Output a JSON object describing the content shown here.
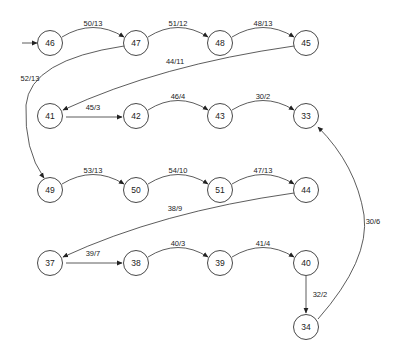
{
  "diagram": {
    "type": "state-transition-graph",
    "start_node": "46",
    "nodes": [
      {
        "id": "46",
        "label": "46",
        "x": 50,
        "y": 43
      },
      {
        "id": "47",
        "label": "47",
        "x": 136,
        "y": 43
      },
      {
        "id": "48",
        "label": "48",
        "x": 220,
        "y": 43
      },
      {
        "id": "45",
        "label": "45",
        "x": 306,
        "y": 43
      },
      {
        "id": "41",
        "label": "41",
        "x": 50,
        "y": 116
      },
      {
        "id": "42",
        "label": "42",
        "x": 136,
        "y": 116
      },
      {
        "id": "43",
        "label": "43",
        "x": 220,
        "y": 116
      },
      {
        "id": "33",
        "label": "33",
        "x": 306,
        "y": 116
      },
      {
        "id": "49",
        "label": "49",
        "x": 50,
        "y": 190
      },
      {
        "id": "50",
        "label": "50",
        "x": 136,
        "y": 190
      },
      {
        "id": "51",
        "label": "51",
        "x": 220,
        "y": 190
      },
      {
        "id": "44",
        "label": "44",
        "x": 306,
        "y": 190
      },
      {
        "id": "37",
        "label": "37",
        "x": 50,
        "y": 263
      },
      {
        "id": "38",
        "label": "38",
        "x": 136,
        "y": 263
      },
      {
        "id": "39",
        "label": "39",
        "x": 220,
        "y": 263
      },
      {
        "id": "40",
        "label": "40",
        "x": 306,
        "y": 263
      },
      {
        "id": "34",
        "label": "34",
        "x": 306,
        "y": 327
      }
    ],
    "edges": [
      {
        "from": "46",
        "to": "47",
        "label": "50/13"
      },
      {
        "from": "47",
        "to": "48",
        "label": "51/12"
      },
      {
        "from": "48",
        "to": "45",
        "label": "48/13"
      },
      {
        "from": "45",
        "to": "41",
        "label": "44/11"
      },
      {
        "from": "47",
        "to": "49",
        "label": "52/13"
      },
      {
        "from": "41",
        "to": "42",
        "label": "45/3"
      },
      {
        "from": "42",
        "to": "43",
        "label": "46/4"
      },
      {
        "from": "43",
        "to": "33",
        "label": "30/2"
      },
      {
        "from": "49",
        "to": "50",
        "label": "53/13"
      },
      {
        "from": "50",
        "to": "51",
        "label": "54/10"
      },
      {
        "from": "51",
        "to": "44",
        "label": "47/13"
      },
      {
        "from": "44",
        "to": "37",
        "label": "38/9"
      },
      {
        "from": "37",
        "to": "38",
        "label": "39/7"
      },
      {
        "from": "38",
        "to": "39",
        "label": "40/3"
      },
      {
        "from": "39",
        "to": "40",
        "label": "41/4"
      },
      {
        "from": "40",
        "to": "34",
        "label": "32/2"
      },
      {
        "from": "34",
        "to": "33",
        "label": "30/6"
      }
    ]
  },
  "nodes": {
    "n46": "46",
    "n47": "47",
    "n48": "48",
    "n45": "45",
    "n41": "41",
    "n42": "42",
    "n43": "43",
    "n33": "33",
    "n49": "49",
    "n50": "50",
    "n51": "51",
    "n44": "44",
    "n37": "37",
    "n38": "38",
    "n39": "39",
    "n40": "40",
    "n34": "34"
  },
  "edge_labels": {
    "e46_47": "50/13",
    "e47_48": "51/12",
    "e48_45": "48/13",
    "e45_41": "44/11",
    "e47_49": "52/13",
    "e41_42": "45/3",
    "e42_43": "46/4",
    "e43_33": "30/2",
    "e49_50": "53/13",
    "e50_51": "54/10",
    "e51_44": "47/13",
    "e44_37": "38/9",
    "e37_38": "39/7",
    "e38_39": "40/3",
    "e39_40": "41/4",
    "e40_34": "32/2",
    "e34_33": "30/6"
  }
}
